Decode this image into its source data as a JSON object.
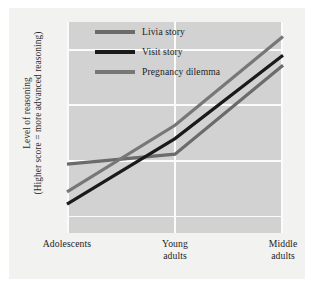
{
  "chart_data": {
    "type": "line",
    "title": "",
    "subtitle": "",
    "xlabel": "",
    "ylabel_line1": "Level of reasoning",
    "ylabel_line2": "(Higher score = more advanced reasoning)",
    "categories": [
      "Adolescents",
      "Young\nadults",
      "Middle\nadults"
    ],
    "category_labels_flat": [
      "Adolescents",
      "Young adults",
      "Middle adults"
    ],
    "yticks": [
      2.5,
      3.0,
      3.5,
      4.0
    ],
    "ytick_labels": [
      "2.5",
      "3.0",
      "3.5",
      "4.0"
    ],
    "ylim": [
      2.35,
      4.25
    ],
    "grid": true,
    "grid_color": "#fbfbfb",
    "plot_background": "#d2d2d2",
    "figure_background": "#f2f2f0",
    "legend_position": "top-left-inside",
    "series": [
      {
        "name": "Livia story",
        "color": "#6b6b6b",
        "values": [
          2.97,
          3.06,
          3.86
        ]
      },
      {
        "name": "Visit story",
        "color": "#1a1a1a",
        "values": [
          2.61,
          3.2,
          3.95
        ]
      },
      {
        "name": "Pregnancy dilemma",
        "color": "#777777",
        "values": [
          2.72,
          3.32,
          4.12
        ]
      }
    ]
  },
  "legend": {
    "items": [
      {
        "label": "Livia story",
        "color": "#6b6b6b"
      },
      {
        "label": "Visit story",
        "color": "#1a1a1a"
      },
      {
        "label": "Pregnancy dilemma",
        "color": "#777777"
      }
    ]
  }
}
